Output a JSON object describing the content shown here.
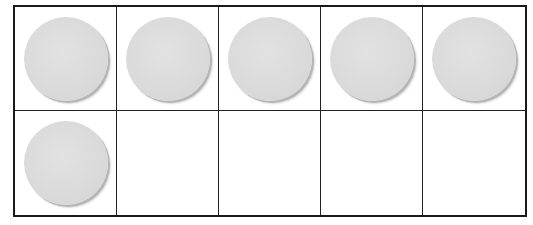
{
  "ten_frame": {
    "rows": 2,
    "columns": 5,
    "filled_count": 6,
    "counter_color": "#dadada",
    "border_color": "#1a1a1a",
    "cells": [
      {
        "row": 1,
        "col": 1,
        "filled": true
      },
      {
        "row": 1,
        "col": 2,
        "filled": true
      },
      {
        "row": 1,
        "col": 3,
        "filled": true
      },
      {
        "row": 1,
        "col": 4,
        "filled": true
      },
      {
        "row": 1,
        "col": 5,
        "filled": true
      },
      {
        "row": 2,
        "col": 1,
        "filled": true
      },
      {
        "row": 2,
        "col": 2,
        "filled": false
      },
      {
        "row": 2,
        "col": 3,
        "filled": false
      },
      {
        "row": 2,
        "col": 4,
        "filled": false
      },
      {
        "row": 2,
        "col": 5,
        "filled": false
      }
    ]
  }
}
